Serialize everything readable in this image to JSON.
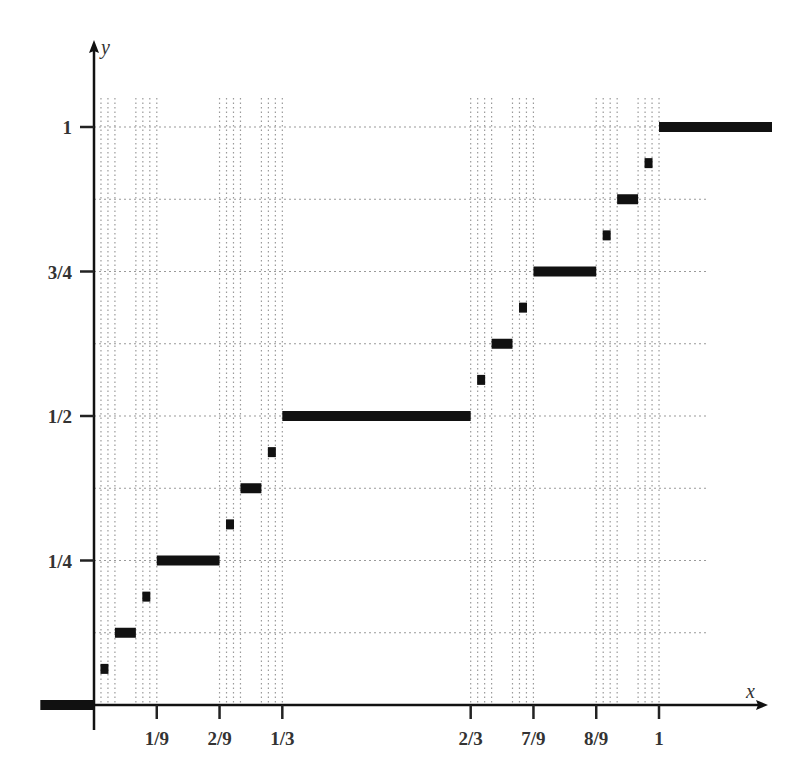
{
  "chart_data": {
    "type": "line",
    "title": "",
    "subtitle": "",
    "xlabel": "x",
    "ylabel": "y",
    "xlim": [
      -0.1,
      1.2
    ],
    "ylim": [
      0,
      1.15
    ],
    "grid": true,
    "legend": null,
    "x_ticks": [
      {
        "value": 0.1111,
        "label": "1/9"
      },
      {
        "value": 0.2222,
        "label": "2/9"
      },
      {
        "value": 0.3333,
        "label": "1/3"
      },
      {
        "value": 0.6667,
        "label": "2/3"
      },
      {
        "value": 0.7778,
        "label": "7/9"
      },
      {
        "value": 0.8889,
        "label": "8/9"
      },
      {
        "value": 1.0,
        "label": "1"
      }
    ],
    "y_ticks": [
      {
        "value": 0.25,
        "label": "1/4"
      },
      {
        "value": 0.5,
        "label": "1/2"
      },
      {
        "value": 0.75,
        "label": "3/4"
      },
      {
        "value": 1.0,
        "label": "1"
      }
    ],
    "horizontal_gridlines": [
      0.125,
      0.25,
      0.375,
      0.5,
      0.625,
      0.75,
      0.875,
      1.0
    ],
    "vertical_gridline_groups_start": [
      0,
      0.0741,
      0.2222,
      0.2963,
      0.6667,
      0.7407,
      0.8889,
      0.963
    ],
    "series": [
      {
        "name": "steps",
        "style": "thick-horizontal-segments",
        "segments": [
          {
            "x0": -0.095,
            "x1": 0.0,
            "y": 0.0
          },
          {
            "x0": 0.037,
            "x1": 0.0741,
            "y": 0.125
          },
          {
            "x0": 0.1111,
            "x1": 0.2222,
            "y": 0.25
          },
          {
            "x0": 0.2593,
            "x1": 0.2963,
            "y": 0.375
          },
          {
            "x0": 0.3333,
            "x1": 0.6667,
            "y": 0.5
          },
          {
            "x0": 0.7037,
            "x1": 0.7407,
            "y": 0.625
          },
          {
            "x0": 0.7778,
            "x1": 0.8889,
            "y": 0.75
          },
          {
            "x0": 0.9259,
            "x1": 0.963,
            "y": 0.875
          },
          {
            "x0": 1.0,
            "x1": 1.2,
            "y": 1.0
          }
        ]
      },
      {
        "name": "level-3 markers",
        "style": "square",
        "points": [
          {
            "x": 0.0185,
            "y": 0.0625
          },
          {
            "x": 0.0926,
            "y": 0.1875
          },
          {
            "x": 0.2407,
            "y": 0.3125
          },
          {
            "x": 0.3148,
            "y": 0.4375
          },
          {
            "x": 0.6852,
            "y": 0.5625
          },
          {
            "x": 0.7593,
            "y": 0.6875
          },
          {
            "x": 0.9074,
            "y": 0.8125
          },
          {
            "x": 0.9815,
            "y": 0.9375
          }
        ]
      }
    ],
    "colors": {
      "ink": "#111111",
      "grid": "#9a9a9a",
      "label": "#333333"
    }
  }
}
